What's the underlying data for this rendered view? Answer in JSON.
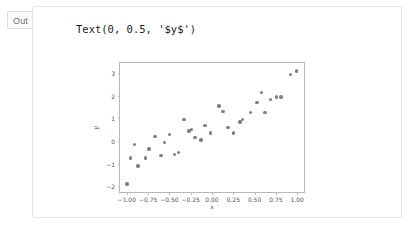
{
  "cell": {
    "prompt_label": "Out",
    "repr_text": "Text(0, 0.5, '$y$')"
  },
  "colors": {
    "point": "#7f7f7f",
    "spine": "#b8b8b8",
    "tick_label": "#555555",
    "text": "#1b1b1b",
    "prompt": "#6e6e6e",
    "container_border": "#e4e4e4",
    "background": "#ffffff"
  },
  "chart_data": {
    "type": "scatter",
    "title": "",
    "xlabel": "x",
    "ylabel": "y",
    "xlim": [
      -1.08,
      1.08
    ],
    "ylim": [
      -2.25,
      3.45
    ],
    "grid": false,
    "legend": null,
    "xticks": [
      -1.0,
      -0.75,
      -0.5,
      -0.25,
      0.0,
      0.25,
      0.5,
      0.75,
      1.0
    ],
    "xtick_labels": [
      "-1.00",
      "-0.75",
      "-0.50",
      "-0.25",
      "0.00",
      "0.25",
      "0.50",
      "0.75",
      "1.00"
    ],
    "yticks": [
      -2,
      -1,
      0,
      1,
      2,
      3
    ],
    "ytick_labels": [
      "-2",
      "-1",
      "0",
      "1",
      "2",
      "3"
    ],
    "marker": "o",
    "marker_color": "#7f7f7f",
    "series": [
      {
        "name": "data",
        "points": [
          [
            -1.0,
            -1.9
          ],
          [
            -0.96,
            -0.75
          ],
          [
            -0.91,
            -0.15
          ],
          [
            -0.87,
            -1.1
          ],
          [
            -0.78,
            -0.75
          ],
          [
            -0.74,
            -0.35
          ],
          [
            -0.67,
            0.2
          ],
          [
            -0.6,
            -0.65
          ],
          [
            -0.56,
            -0.05
          ],
          [
            -0.5,
            0.3
          ],
          [
            -0.44,
            -0.6
          ],
          [
            -0.39,
            -0.5
          ],
          [
            -0.33,
            0.95
          ],
          [
            -0.27,
            0.45
          ],
          [
            -0.24,
            0.5
          ],
          [
            -0.2,
            0.15
          ],
          [
            -0.13,
            0.05
          ],
          [
            -0.08,
            0.7
          ],
          [
            -0.02,
            0.35
          ],
          [
            0.08,
            1.55
          ],
          [
            0.13,
            1.3
          ],
          [
            0.19,
            0.6
          ],
          [
            0.25,
            0.35
          ],
          [
            0.33,
            0.85
          ],
          [
            0.36,
            0.95
          ],
          [
            0.45,
            1.25
          ],
          [
            0.53,
            1.7
          ],
          [
            0.58,
            2.15
          ],
          [
            0.62,
            1.25
          ],
          [
            0.69,
            1.85
          ],
          [
            0.76,
            1.95
          ],
          [
            0.81,
            1.95
          ],
          [
            0.92,
            2.95
          ],
          [
            0.99,
            3.1
          ]
        ]
      }
    ]
  }
}
